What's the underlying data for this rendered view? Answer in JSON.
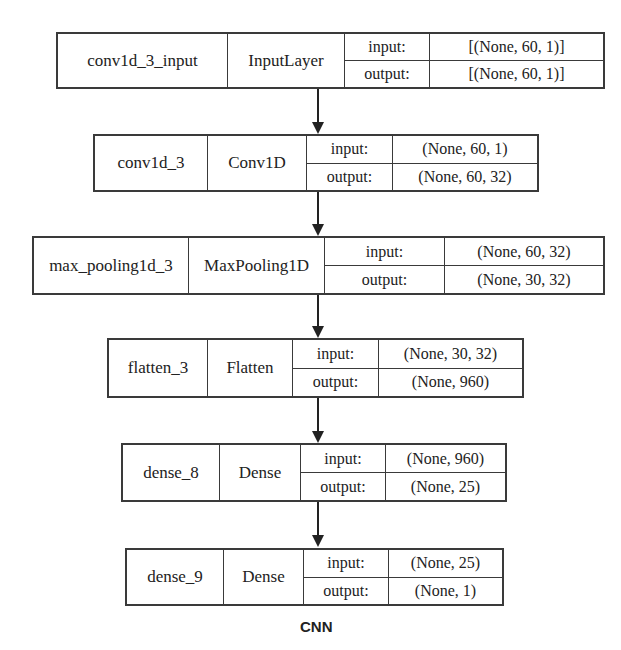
{
  "diagram": {
    "caption": "CNN",
    "io_labels": {
      "input": "input:",
      "output": "output:"
    },
    "layers": [
      {
        "name": "conv1d_3_input",
        "type": "InputLayer",
        "input": "[(None, 60, 1)]",
        "output": "[(None, 60, 1)]"
      },
      {
        "name": "conv1d_3",
        "type": "Conv1D",
        "input": "(None, 60, 1)",
        "output": "(None, 60, 32)"
      },
      {
        "name": "max_pooling1d_3",
        "type": "MaxPooling1D",
        "input": "(None, 60, 32)",
        "output": "(None, 30, 32)"
      },
      {
        "name": "flatten_3",
        "type": "Flatten",
        "input": "(None, 30, 32)",
        "output": "(None, 960)"
      },
      {
        "name": "dense_8",
        "type": "Dense",
        "input": "(None, 960)",
        "output": "(None, 25)"
      },
      {
        "name": "dense_9",
        "type": "Dense",
        "input": "(None, 25)",
        "output": "(None, 1)"
      }
    ],
    "edges": [
      {
        "from": "conv1d_3_input",
        "to": "conv1d_3"
      },
      {
        "from": "conv1d_3",
        "to": "max_pooling1d_3"
      },
      {
        "from": "max_pooling1d_3",
        "to": "flatten_3"
      },
      {
        "from": "flatten_3",
        "to": "dense_8"
      },
      {
        "from": "dense_8",
        "to": "dense_9"
      }
    ]
  }
}
